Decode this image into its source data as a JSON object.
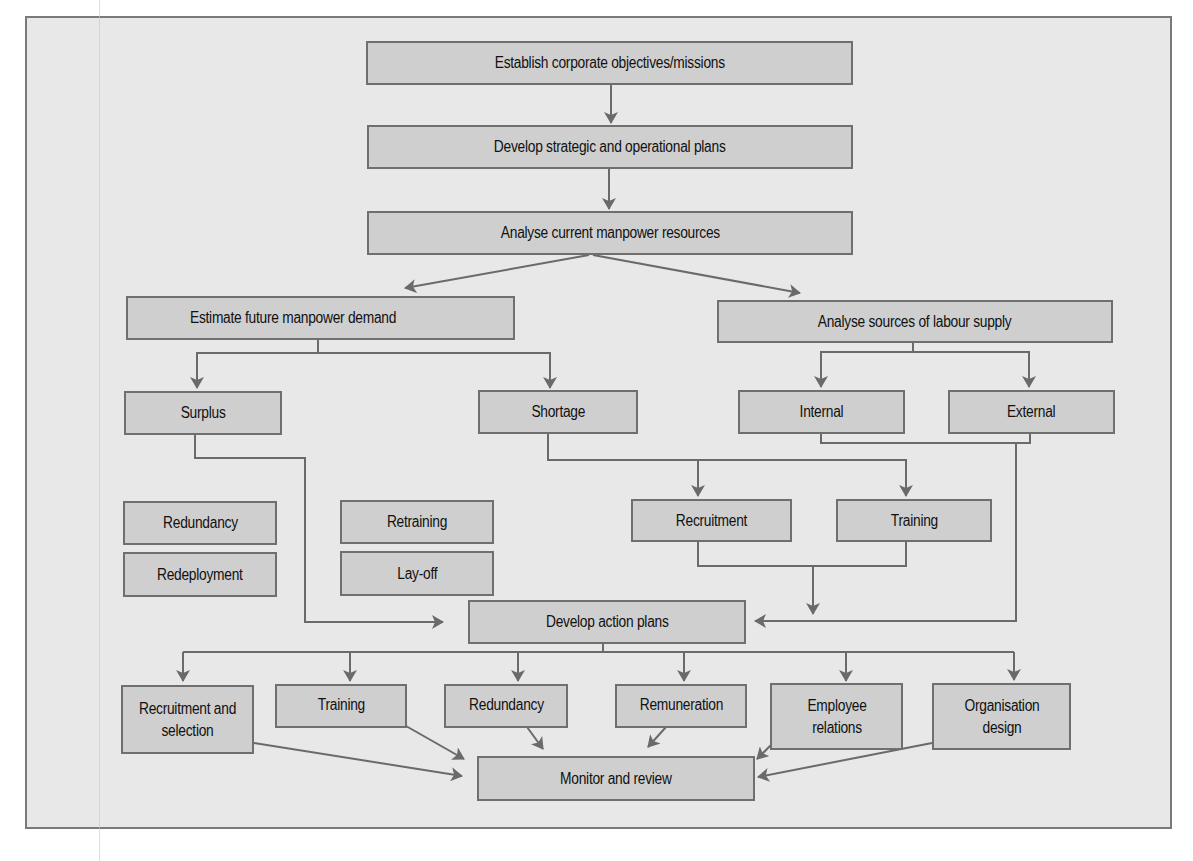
{
  "diagram": {
    "type": "flowchart",
    "colors": {
      "background": "#e8e8e8",
      "box_fill": "#cfcfcf",
      "box_border": "#6f6f6f",
      "arrow": "#6a6a6a",
      "text": "#111111"
    },
    "nodes": {
      "objectives": "Establish corporate objectives/missions",
      "plans": "Develop strategic and operational plans",
      "analyse_current": "Analyse current manpower resources",
      "estimate_demand": "Estimate future manpower demand",
      "labour_supply": "Analyse sources of labour supply",
      "surplus": "Surplus",
      "shortage": "Shortage",
      "internal": "Internal",
      "external": "External",
      "redundancy_opt": "Redundancy",
      "redeployment_opt": "Redeployment",
      "retraining_opt": "Retraining",
      "layoff_opt": "Lay-off",
      "recruitment": "Recruitment",
      "training": "Training",
      "action_plans": "Develop action plans",
      "out_recruitment": "Recruitment and selection",
      "out_training": "Training",
      "out_redundancy": "Redundancy",
      "out_remuneration": "Remuneration",
      "out_employee_relations": "Employee relations",
      "out_organisation_design": "Organisation design",
      "monitor": "Monitor and review"
    },
    "edges": [
      [
        "objectives",
        "plans"
      ],
      [
        "plans",
        "analyse_current"
      ],
      [
        "analyse_current",
        "estimate_demand"
      ],
      [
        "analyse_current",
        "labour_supply"
      ],
      [
        "estimate_demand",
        "surplus"
      ],
      [
        "estimate_demand",
        "shortage"
      ],
      [
        "labour_supply",
        "internal"
      ],
      [
        "labour_supply",
        "external"
      ],
      [
        "surplus",
        "action_plans"
      ],
      [
        "shortage",
        "recruitment"
      ],
      [
        "shortage",
        "training"
      ],
      [
        "recruitment",
        "action_plans"
      ],
      [
        "training",
        "action_plans"
      ],
      [
        "internal",
        "action_plans"
      ],
      [
        "external",
        "action_plans"
      ],
      [
        "action_plans",
        "out_recruitment"
      ],
      [
        "action_plans",
        "out_training"
      ],
      [
        "action_plans",
        "out_redundancy"
      ],
      [
        "action_plans",
        "out_remuneration"
      ],
      [
        "action_plans",
        "out_employee_relations"
      ],
      [
        "action_plans",
        "out_organisation_design"
      ],
      [
        "out_recruitment",
        "monitor"
      ],
      [
        "out_training",
        "monitor"
      ],
      [
        "out_redundancy",
        "monitor"
      ],
      [
        "out_remuneration",
        "monitor"
      ],
      [
        "out_employee_relations",
        "monitor"
      ],
      [
        "out_organisation_design",
        "monitor"
      ]
    ]
  }
}
